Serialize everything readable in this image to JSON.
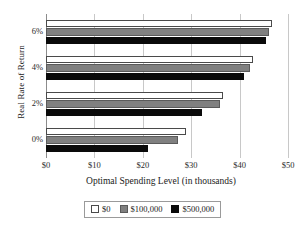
{
  "chart_data": {
    "type": "bar",
    "orientation": "horizontal",
    "title": "",
    "xlabel": "Optimal Spending Level (in thousands)",
    "ylabel": "Real Rate of Return",
    "categories": [
      "0%",
      "2%",
      "4%",
      "6%"
    ],
    "xlim": [
      0,
      50
    ],
    "xticks": [
      0,
      10,
      20,
      30,
      40,
      50
    ],
    "xtick_labels": [
      "$0",
      "$10",
      "$20",
      "$30",
      "$40",
      "$50"
    ],
    "ytick_labels": [
      "0%",
      "2%",
      "4%",
      "6%"
    ],
    "grid": "vertical",
    "legend_position": "bottom",
    "series": [
      {
        "name": "$0",
        "color": "#ffffff",
        "edge_color": "#4a4a4a",
        "values": [
          28.9,
          36.5,
          42.7,
          46.7
        ]
      },
      {
        "name": "$100,000",
        "color": "#808080",
        "edge_color": "#5a5a5a",
        "values": [
          27.3,
          35.9,
          42.1,
          46.1
        ]
      },
      {
        "name": "$500,000",
        "color": "#0a0a0a",
        "edge_color": "#0a0a0a",
        "values": [
          21.0,
          32.3,
          41.0,
          45.5
        ]
      }
    ]
  },
  "legend": {
    "items": [
      {
        "label": "$0",
        "swatch": "white-swatch"
      },
      {
        "label": "$100,000",
        "swatch": "gray-swatch"
      },
      {
        "label": "$500,000",
        "swatch": "black-swatch"
      }
    ]
  }
}
